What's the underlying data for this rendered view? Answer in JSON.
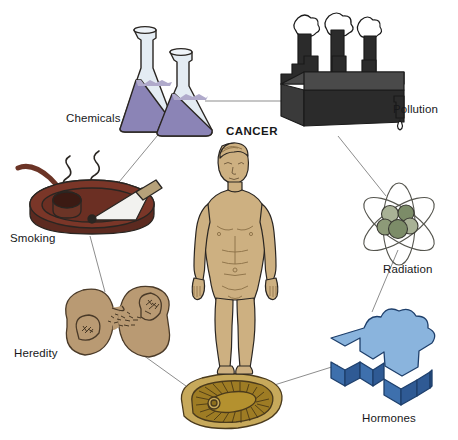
{
  "diagram": {
    "title_center": "CANCER",
    "type": "radial-concept-diagram",
    "center": {
      "label": "CANCER",
      "icon": "human-body-figure",
      "skin_color": "#cdb081",
      "outline_color": "#2a2622"
    },
    "link_color": "#8d8d8d",
    "background": "#ffffff",
    "nodes": [
      {
        "id": "chemicals",
        "label": "Chemicals",
        "icon": "erlenmeyer-flasks-icon",
        "label_x": 66,
        "label_y": 113,
        "colors": {
          "liquid": "#8b84b6",
          "liquid_dark": "#6e6699",
          "glass": "#dfe7ee",
          "outline": "#2a2622"
        }
      },
      {
        "id": "pollution",
        "label": "Pollution",
        "icon": "factory-smokestacks-icon",
        "label_x": 393,
        "label_y": 104,
        "colors": {
          "body": "#2b2b2b",
          "top": "#4a4a4a",
          "side": "#3a3a3a",
          "smoke": "#ffffff",
          "outline": "#1a1a1a"
        }
      },
      {
        "id": "radiation",
        "label": "Radiation",
        "icon": "atom-nucleus-icon",
        "label_x": 383,
        "label_y": 264,
        "colors": {
          "nucleus": "#7c8c68",
          "nucleus_light": "#a9b296",
          "orbit": "#55554e",
          "outline": "#3a3a33"
        }
      },
      {
        "id": "hormones",
        "label": "Hormones",
        "icon": "hormone-molecule-block-icon",
        "label_x": 362,
        "label_y": 413,
        "colors": {
          "top": "#8ab4dd",
          "side_left": "#3e70ad",
          "side_right": "#2f5a94",
          "outline": "#1e3f6b"
        }
      },
      {
        "id": "heredity",
        "label": "Heredity",
        "icon": "dividing-cell-icon",
        "label_x": 14,
        "label_y": 348,
        "colors": {
          "cell": "#b99a73",
          "outline": "#4a3a28",
          "chromatin": "#4a3a28"
        }
      },
      {
        "id": "smoking",
        "label": "Smoking",
        "icon": "ashtray-pipe-cigarette-icon",
        "label_x": 10,
        "label_y": 233,
        "colors": {
          "tray": "#7a3628",
          "tray_dark": "#562219",
          "rim": "#8c4332",
          "cigarette": "#f2f2ef",
          "filter": "#b6a179",
          "smoke": "#2a2622"
        }
      },
      {
        "id": "organ",
        "label": "",
        "icon": "organ-cross-section-icon",
        "colors": {
          "fill": "#b4912f",
          "fill_light": "#c7a95b",
          "outline": "#4a3a1c"
        }
      }
    ],
    "links": [
      {
        "from": "chemicals",
        "to": "pollution"
      },
      {
        "from": "chemicals",
        "to": "smoking"
      },
      {
        "from": "pollution",
        "to": "radiation"
      },
      {
        "from": "radiation",
        "to": "hormones"
      },
      {
        "from": "hormones",
        "to": "organ"
      },
      {
        "from": "organ",
        "to": "heredity"
      },
      {
        "from": "heredity",
        "to": "smoking"
      }
    ]
  }
}
